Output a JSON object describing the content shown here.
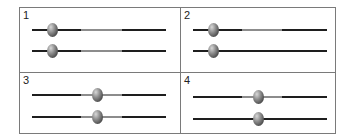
{
  "panels": [
    {
      "label": "1",
      "sliders": [
        {
          "knob": 20,
          "segments": [
            {
              "from": 0,
              "to": 49,
              "tone": "dark"
            },
            {
              "from": 49,
              "to": 90,
              "tone": "light"
            },
            {
              "from": 90,
              "to": 134,
              "tone": "dark"
            }
          ]
        },
        {
          "knob": 20,
          "segments": [
            {
              "from": 0,
              "to": 49,
              "tone": "dark"
            },
            {
              "from": 49,
              "to": 90,
              "tone": "light"
            },
            {
              "from": 90,
              "to": 134,
              "tone": "dark"
            }
          ]
        }
      ]
    },
    {
      "label": "2",
      "sliders": [
        {
          "knob": 20,
          "segments": [
            {
              "from": 0,
              "to": 49,
              "tone": "dark"
            },
            {
              "from": 49,
              "to": 89,
              "tone": "light"
            },
            {
              "from": 89,
              "to": 134,
              "tone": "dark"
            }
          ]
        },
        {
          "knob": 20,
          "segments": [
            {
              "from": 0,
              "to": 134,
              "tone": "dark"
            }
          ]
        }
      ]
    },
    {
      "label": "3",
      "sliders": [
        {
          "knob": 65,
          "segments": [
            {
              "from": 0,
              "to": 49,
              "tone": "dark"
            },
            {
              "from": 49,
              "to": 90,
              "tone": "light"
            },
            {
              "from": 90,
              "to": 134,
              "tone": "dark"
            }
          ]
        },
        {
          "knob": 65,
          "segments": [
            {
              "from": 0,
              "to": 49,
              "tone": "dark"
            },
            {
              "from": 49,
              "to": 90,
              "tone": "light"
            },
            {
              "from": 90,
              "to": 134,
              "tone": "dark"
            }
          ]
        }
      ]
    },
    {
      "label": "4",
      "sliders": [
        {
          "knob": 65,
          "segments": [
            {
              "from": 0,
              "to": 49,
              "tone": "dark"
            },
            {
              "from": 49,
              "to": 89,
              "tone": "light"
            },
            {
              "from": 89,
              "to": 134,
              "tone": "dark"
            }
          ]
        },
        {
          "knob": 65,
          "segments": [
            {
              "from": 0,
              "to": 134,
              "tone": "dark"
            }
          ]
        }
      ]
    }
  ],
  "colors": {
    "border": "#7a7a7a",
    "track_dark": "#1e1e1e",
    "track_light": "#8c8c8c",
    "knob": "#555555"
  }
}
